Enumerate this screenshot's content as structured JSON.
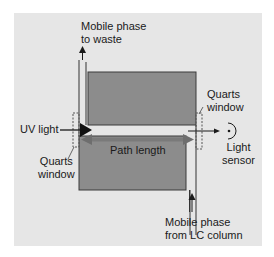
{
  "diagram": {
    "type": "UV flow cell schematic",
    "labels": {
      "outlet": [
        "Mobile phase",
        "to waste"
      ],
      "inlet": [
        "Mobile phase",
        "from LC column"
      ],
      "uv_light": "UV light",
      "left_window": [
        "Quarts",
        "window"
      ],
      "right_window": [
        "Quarts",
        "window"
      ],
      "path_length": "Path length",
      "sensor": [
        "Light",
        "sensor"
      ]
    },
    "colors": {
      "background": "#e6e6e6",
      "cell_block": "#8c8c8c",
      "cell_border": "#3a3a3a",
      "path_arrow": "#6e6e6e",
      "line": "#1a1a1a"
    },
    "icons": {
      "uv-light-arrow": "filled triangle arrowhead",
      "light-sensor": "arc with dot",
      "flow-arrow": "upward arrow"
    }
  }
}
